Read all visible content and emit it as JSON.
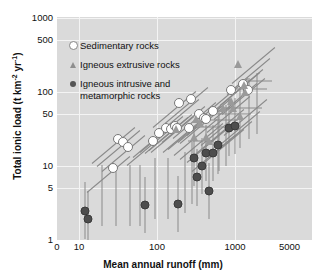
{
  "chart_data": {
    "type": "scatter",
    "title": "",
    "xlabel": "Mean annual runoff (mm)",
    "ylabel": "Total ionic load (t km⁻² yr⁻¹)",
    "ylabel_main": "Total ionic load (t km",
    "ylabel_sup1": "-2",
    "ylabel_mid": " yr",
    "ylabel_sup2": "-1",
    "ylabel_end": ")",
    "xscale": "log",
    "yscale": "log",
    "xlim": [
      8,
      5000
    ],
    "ylim": [
      1,
      1000
    ],
    "grid": true,
    "legend_position": "upper-left inside plot",
    "xticks": [
      {
        "label": "0",
        "value": 8
      },
      {
        "label": "10",
        "value": 10
      },
      {
        "label": "100",
        "value": 100
      },
      {
        "label": "1000",
        "value": 1000
      },
      {
        "label": "5000",
        "value": 5000
      }
    ],
    "yticks": [
      {
        "label": "1000",
        "value": 1000
      },
      {
        "label": "500",
        "value": 500
      },
      {
        "label": "100",
        "value": 100
      },
      {
        "label": "50",
        "value": 50
      },
      {
        "label": "10",
        "value": 10
      },
      {
        "label": "5",
        "value": 5
      },
      {
        "label": "1",
        "value": 1
      }
    ],
    "legend": [
      {
        "key": "sedimentary",
        "label": "Sedimentary rocks",
        "marker": "open-circle",
        "color": "#ffffff"
      },
      {
        "key": "extrusive",
        "label": "Igneous extrusive rocks",
        "marker": "triangle",
        "color": "#9a9a9a"
      },
      {
        "key": "intrusive",
        "label": "Igneous intrusive and\nmetamorphic rocks",
        "marker": "filled-circle",
        "color": "#4d4d4d"
      }
    ],
    "series": [
      {
        "name": "Sedimentary rocks",
        "marker": "open-circle",
        "points": [
          {
            "x": 32,
            "y": 23
          },
          {
            "x": 37,
            "y": 21
          },
          {
            "x": 43,
            "y": 18
          },
          {
            "x": 27,
            "y": 9.5
          },
          {
            "x": 88,
            "y": 22
          },
          {
            "x": 105,
            "y": 28
          },
          {
            "x": 130,
            "y": 33
          },
          {
            "x": 150,
            "y": 32
          },
          {
            "x": 168,
            "y": 35
          },
          {
            "x": 180,
            "y": 33
          },
          {
            "x": 190,
            "y": 70
          },
          {
            "x": 255,
            "y": 33
          },
          {
            "x": 275,
            "y": 80
          },
          {
            "x": 350,
            "y": 50
          },
          {
            "x": 400,
            "y": 45
          },
          {
            "x": 430,
            "y": 43
          },
          {
            "x": 530,
            "y": 55
          },
          {
            "x": 900,
            "y": 105
          },
          {
            "x": 1250,
            "y": 130
          },
          {
            "x": 1450,
            "y": 105
          }
        ]
      },
      {
        "name": "Igneous extrusive rocks",
        "marker": "triangle",
        "points": [
          {
            "x": 175,
            "y": 32
          },
          {
            "x": 320,
            "y": 43
          },
          {
            "x": 360,
            "y": 38
          },
          {
            "x": 300,
            "y": 25
          },
          {
            "x": 420,
            "y": 25
          },
          {
            "x": 470,
            "y": 22
          },
          {
            "x": 700,
            "y": 60
          },
          {
            "x": 880,
            "y": 75
          },
          {
            "x": 930,
            "y": 60
          },
          {
            "x": 1150,
            "y": 48
          },
          {
            "x": 1100,
            "y": 240
          },
          {
            "x": 1300,
            "y": 125
          },
          {
            "x": 1350,
            "y": 100
          }
        ]
      },
      {
        "name": "Igneous intrusive and metamorphic rocks",
        "marker": "filled-circle",
        "points": [
          {
            "x": 12,
            "y": 2.5
          },
          {
            "x": 13,
            "y": 1.9
          },
          {
            "x": 70,
            "y": 3.0
          },
          {
            "x": 185,
            "y": 3.1
          },
          {
            "x": 300,
            "y": 13
          },
          {
            "x": 330,
            "y": 7.0
          },
          {
            "x": 380,
            "y": 10
          },
          {
            "x": 430,
            "y": 15
          },
          {
            "x": 470,
            "y": 4.6
          },
          {
            "x": 520,
            "y": 15
          },
          {
            "x": 610,
            "y": 19
          },
          {
            "x": 830,
            "y": 33
          },
          {
            "x": 1000,
            "y": 35
          }
        ]
      }
    ]
  }
}
